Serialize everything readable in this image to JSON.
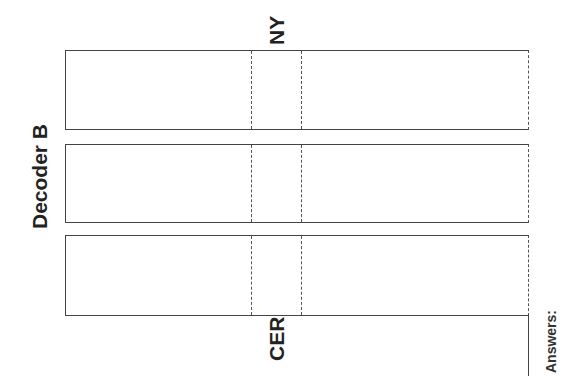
{
  "title": "Decoder B",
  "labels": {
    "top_fold": "NY",
    "bottom_fold": "CER",
    "answers": "Answers:"
  },
  "strips": [
    {
      "id": 1,
      "top": 50,
      "height": 80
    },
    {
      "id": 2,
      "top": 144,
      "height": 79
    },
    {
      "id": 3,
      "top": 235,
      "height": 81
    }
  ],
  "colors": {
    "line": "#444444",
    "text": "#222222",
    "background": "#ffffff"
  }
}
